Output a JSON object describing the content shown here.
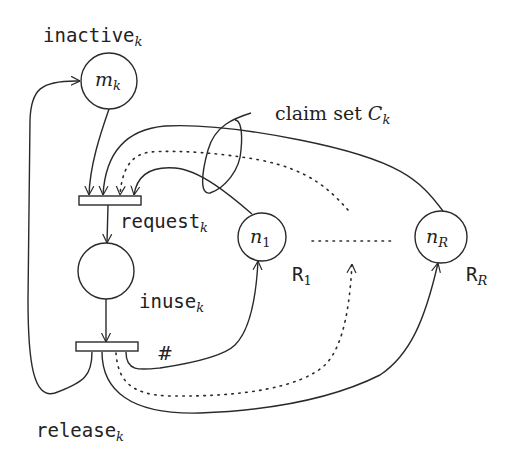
{
  "diagram": {
    "type": "petri-net",
    "places": [
      {
        "id": "inactive",
        "label": "inactive",
        "label_sub": "k",
        "token_label": "m",
        "token_sub": "k"
      },
      {
        "id": "inuse",
        "label": "inuse",
        "label_sub": "k",
        "token_label": "",
        "token_sub": ""
      },
      {
        "id": "n1",
        "label": "R",
        "label_sub": "1",
        "token_label": "n",
        "token_sub": "1"
      },
      {
        "id": "nR",
        "label": "R",
        "label_sub": "R",
        "token_label": "n",
        "token_sub": "R"
      }
    ],
    "transitions": [
      {
        "id": "request",
        "label": "request",
        "label_sub": "k"
      },
      {
        "id": "release",
        "label": "release",
        "label_sub": "k"
      }
    ],
    "annotations": {
      "claim_set": {
        "text": "claim set ",
        "symbol": "C",
        "sub": "k"
      },
      "hash": "#"
    }
  }
}
